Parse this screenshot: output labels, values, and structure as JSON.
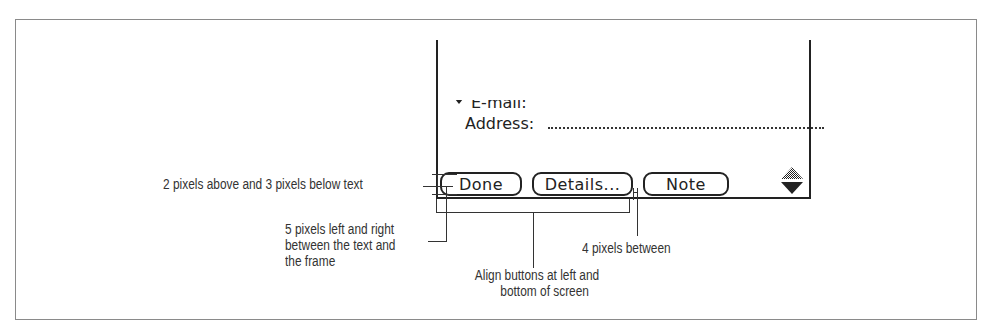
{
  "device_screen": {
    "fields": [
      {
        "label": "E-mail:",
        "partially_visible": true,
        "has_popup_triangle": true
      },
      {
        "label": "Address:"
      }
    ],
    "buttons": [
      {
        "label": "Done"
      },
      {
        "label": "Details..."
      },
      {
        "label": "Note"
      }
    ],
    "scroll_arrows": {
      "icon": "scroll-up-down-arrows-icon"
    }
  },
  "annotations": {
    "vertical_padding": "2 pixels above and 3 pixels below text",
    "horizontal_padding": [
      "5 pixels left and right",
      "between the text and",
      "the frame"
    ],
    "alignment": [
      "Align buttons at left and",
      "bottom of screen"
    ],
    "spacing": "4 pixels between"
  },
  "colors": {
    "ink": "#222222",
    "frame": "#8a8a8a",
    "background": "#ffffff"
  }
}
